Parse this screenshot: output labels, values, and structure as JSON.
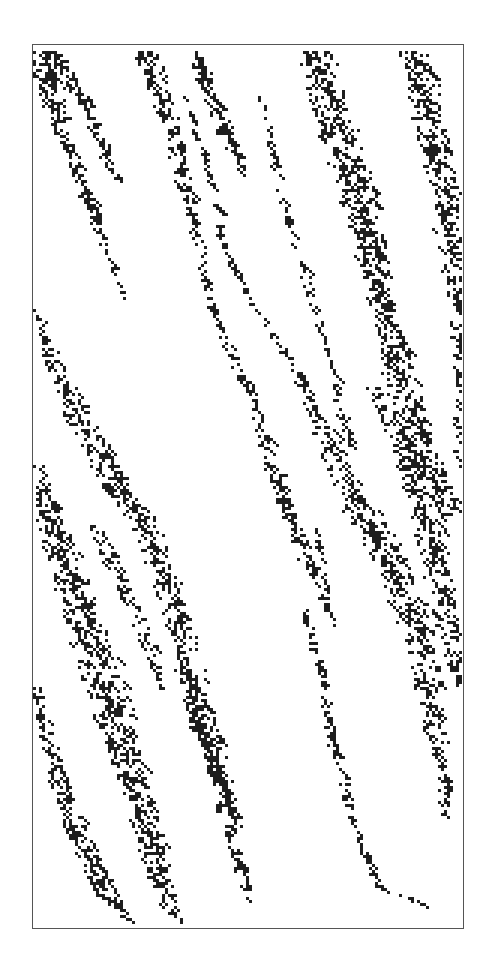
{
  "figure": {
    "frame": {
      "x": 32,
      "y": 44,
      "width": 432,
      "height": 885,
      "border_color": "#555555"
    },
    "cell_size": 3,
    "colors": {
      "on": "#1e1e1e",
      "off": "#ffffff"
    },
    "streaks": [
      {
        "pts": [
          [
            5,
            5
          ],
          [
            30,
            90
          ],
          [
            60,
            170
          ],
          [
            92,
            255
          ]
        ],
        "w": [
          32,
          26,
          16,
          4
        ],
        "d": 0.55
      },
      {
        "pts": [
          [
            20,
            5
          ],
          [
            50,
            60
          ],
          [
            85,
            140
          ]
        ],
        "w": [
          20,
          24,
          10
        ],
        "d": 0.5
      },
      {
        "pts": [
          [
            110,
            5
          ],
          [
            135,
            80
          ],
          [
            160,
            175
          ],
          [
            180,
            270
          ],
          [
            215,
            345
          ],
          [
            245,
            440
          ],
          [
            275,
            520
          ],
          [
            300,
            580
          ]
        ],
        "w": [
          34,
          30,
          14,
          10,
          14,
          22,
          18,
          6
        ],
        "d": 0.5
      },
      {
        "pts": [
          [
            160,
            5
          ],
          [
            185,
            70
          ],
          [
            210,
            130
          ]
        ],
        "w": [
          22,
          26,
          8
        ],
        "d": 0.55
      },
      {
        "pts": [
          [
            225,
            40
          ],
          [
            250,
            160
          ],
          [
            280,
            260
          ],
          [
            300,
            330
          ],
          [
            315,
            400
          ]
        ],
        "w": [
          8,
          12,
          12,
          8,
          18
        ],
        "d": 0.45
      },
      {
        "pts": [
          [
            280,
            5
          ],
          [
            305,
            90
          ],
          [
            330,
            170
          ],
          [
            350,
            260
          ],
          [
            370,
            350
          ],
          [
            395,
            420
          ],
          [
            420,
            470
          ]
        ],
        "w": [
          40,
          44,
          40,
          34,
          40,
          36,
          24
        ],
        "d": 0.55
      },
      {
        "pts": [
          [
            380,
            5
          ],
          [
            400,
            90
          ],
          [
            415,
            180
          ],
          [
            428,
            260
          ],
          [
            430,
            420
          ]
        ],
        "w": [
          40,
          40,
          36,
          30,
          20
        ],
        "d": 0.5
      },
      {
        "pts": [
          [
            150,
            45
          ],
          [
            170,
            110
          ],
          [
            190,
            200
          ],
          [
            220,
            260
          ],
          [
            265,
            330
          ],
          [
            300,
            410
          ],
          [
            330,
            470
          ],
          [
            360,
            520
          ],
          [
            385,
            590
          ],
          [
            400,
            680
          ],
          [
            415,
            770
          ]
        ],
        "w": [
          8,
          10,
          10,
          8,
          16,
          30,
          40,
          44,
          36,
          28,
          14
        ],
        "d": 0.5
      },
      {
        "pts": [
          [
            340,
            340
          ],
          [
            370,
            400
          ],
          [
            395,
            480
          ],
          [
            410,
            560
          ],
          [
            425,
            640
          ]
        ],
        "w": [
          20,
          30,
          36,
          30,
          20
        ],
        "d": 0.55
      },
      {
        "pts": [
          [
            270,
            560
          ],
          [
            285,
            620
          ],
          [
            300,
            700
          ],
          [
            320,
            780
          ],
          [
            345,
            840
          ],
          [
            395,
            860
          ]
        ],
        "w": [
          8,
          12,
          14,
          10,
          14,
          16
        ],
        "d": 0.5
      },
      {
        "pts": [
          [
            280,
            480
          ],
          [
            295,
            560
          ]
        ],
        "w": [
          10,
          6
        ],
        "d": 0.5
      },
      {
        "pts": [
          [
            2,
            260
          ],
          [
            20,
            320
          ],
          [
            50,
            380
          ],
          [
            85,
            440
          ],
          [
            115,
            490
          ],
          [
            140,
            560
          ],
          [
            160,
            640
          ],
          [
            180,
            710
          ],
          [
            200,
            790
          ],
          [
            215,
            860
          ]
        ],
        "w": [
          8,
          24,
          34,
          36,
          34,
          30,
          34,
          30,
          22,
          10
        ],
        "d": 0.5
      },
      {
        "pts": [
          [
            2,
            420
          ],
          [
            25,
            500
          ],
          [
            50,
            570
          ],
          [
            70,
            640
          ],
          [
            95,
            720
          ],
          [
            115,
            790
          ],
          [
            135,
            860
          ],
          [
            150,
            880
          ]
        ],
        "w": [
          20,
          36,
          44,
          46,
          40,
          36,
          22,
          8
        ],
        "d": 0.55
      },
      {
        "pts": [
          [
            2,
            640
          ],
          [
            20,
            720
          ],
          [
            45,
            790
          ],
          [
            75,
            850
          ],
          [
            100,
            880
          ]
        ],
        "w": [
          12,
          22,
          30,
          28,
          14
        ],
        "d": 0.55
      },
      {
        "pts": [
          [
            60,
            480
          ],
          [
            90,
            540
          ],
          [
            115,
            600
          ],
          [
            130,
            650
          ]
        ],
        "w": [
          14,
          22,
          18,
          8
        ],
        "d": 0.5
      },
      {
        "pts": [
          [
            150,
            620
          ],
          [
            165,
            680
          ],
          [
            180,
            720
          ],
          [
            200,
            770
          ]
        ],
        "w": [
          12,
          20,
          24,
          14
        ],
        "d": 0.55
      }
    ],
    "seed": 146
  }
}
